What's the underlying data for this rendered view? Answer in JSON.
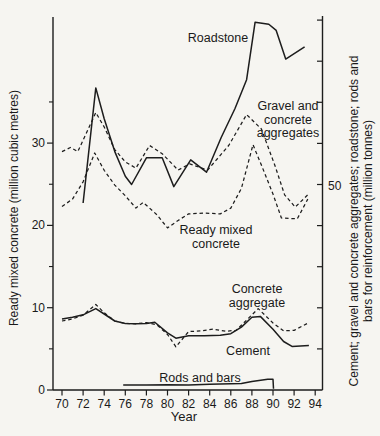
{
  "chart_data": {
    "type": "line",
    "title": "",
    "xlabel": "Year",
    "ylabel_left": "Ready mixed concrete (million cubic metres)",
    "ylabel_right": "Cement; gravel and concrete aggregates; roadstone; rods and bars for reinforcement (million tonnes)",
    "ylabel_right_lines": [
      "Cement; gravel and concrete aggregates; roadstone; rods and",
      "bars for reinforcement (million tonnes)"
    ],
    "colors": {
      "line": "#1d1d1d",
      "background": "#f6f5f1"
    },
    "x_axis": {
      "tick_years": [
        70,
        72,
        74,
        76,
        78,
        80,
        82,
        84,
        86,
        88,
        90,
        92,
        94
      ],
      "tick_labels": [
        "70",
        "72",
        "74",
        "76",
        "78",
        "80",
        "82",
        "84",
        "86",
        "88",
        "90",
        "92",
        "94"
      ],
      "range": [
        69.1,
        94.7
      ]
    },
    "left_axis": {
      "ticks": [
        0,
        10,
        20,
        30
      ],
      "tick_labels": [
        "0",
        "10",
        "20",
        "30"
      ],
      "minor_ticks": [
        5,
        15,
        25,
        35
      ],
      "range": [
        0,
        45.3
      ],
      "units": "million cubic metres"
    },
    "right_axis": {
      "ticks": [
        10,
        20,
        30,
        40,
        50,
        60,
        70,
        80,
        90
      ],
      "labeled_tick": 50,
      "labeled_tick_text": "50",
      "range": [
        0,
        91
      ],
      "units": "million tonnes"
    },
    "series": [
      {
        "id": "roadstone",
        "name": "Roadstone",
        "axis": "right",
        "style": "solid",
        "points": [
          [
            72,
            45.5
          ],
          [
            73.2,
            73.5
          ],
          [
            74,
            66
          ],
          [
            75,
            58
          ],
          [
            76,
            52
          ],
          [
            76.6,
            50
          ],
          [
            78,
            56.5
          ],
          [
            79.5,
            56.5
          ],
          [
            80.6,
            49.5
          ],
          [
            82.2,
            56
          ],
          [
            83.7,
            53
          ],
          [
            85.1,
            61.5
          ],
          [
            86.4,
            68.5
          ],
          [
            87.5,
            75.5
          ],
          [
            88.3,
            89.5
          ],
          [
            89.6,
            89
          ],
          [
            90.3,
            87.5
          ],
          [
            91.2,
            80.5
          ],
          [
            93,
            83.5
          ]
        ]
      },
      {
        "id": "gravel",
        "name": "Gravel and concrete aggregates",
        "axis": "right",
        "style": "dashed",
        "points": [
          [
            70,
            58
          ],
          [
            70.8,
            59
          ],
          [
            71.5,
            58
          ],
          [
            73.2,
            67.5
          ],
          [
            74,
            64
          ],
          [
            75,
            58.5
          ],
          [
            76,
            55.5
          ],
          [
            77,
            54
          ],
          [
            78.3,
            59.5
          ],
          [
            79.5,
            57.5
          ],
          [
            81,
            53.5
          ],
          [
            82.1,
            55
          ],
          [
            83.8,
            53.5
          ],
          [
            85.8,
            59.5
          ],
          [
            87.5,
            67
          ],
          [
            88.9,
            63.5
          ],
          [
            90.2,
            54.5
          ],
          [
            91.1,
            47.5
          ],
          [
            92.1,
            44.5
          ],
          [
            93.3,
            47.5
          ]
        ]
      },
      {
        "id": "ready-mixed",
        "name": "Ready mixed concrete",
        "axis": "left",
        "style": "dashed",
        "points": [
          [
            70,
            22.3
          ],
          [
            71,
            23.2
          ],
          [
            72,
            25.3
          ],
          [
            73.1,
            28.8
          ],
          [
            74,
            26.7
          ],
          [
            75,
            24.9
          ],
          [
            76,
            23.6
          ],
          [
            77,
            22.1
          ],
          [
            77.7,
            22.8
          ],
          [
            79,
            21.3
          ],
          [
            80,
            19.7
          ],
          [
            81,
            20.6
          ],
          [
            82,
            21.4
          ],
          [
            83.5,
            21.5
          ],
          [
            85,
            21.4
          ],
          [
            86,
            22.1
          ],
          [
            87,
            24.5
          ],
          [
            88.1,
            29.8
          ],
          [
            89,
            27
          ],
          [
            90,
            23.8
          ],
          [
            90.8,
            20.9
          ],
          [
            92.3,
            20.8
          ],
          [
            93.3,
            23.2
          ]
        ]
      },
      {
        "id": "concrete-aggregate",
        "name": "Concrete aggregate",
        "axis": "right",
        "style": "dashed",
        "points": [
          [
            70,
            16.8
          ],
          [
            71,
            17.3
          ],
          [
            72,
            18.2
          ],
          [
            73.2,
            20.8
          ],
          [
            74,
            18.8
          ],
          [
            75,
            16.8
          ],
          [
            76,
            16.2
          ],
          [
            77,
            16.1
          ],
          [
            78,
            16.4
          ],
          [
            79,
            15.9
          ],
          [
            80,
            13.5
          ],
          [
            80.8,
            10.5
          ],
          [
            82,
            14.2
          ],
          [
            83.2,
            14.4
          ],
          [
            84.3,
            14.8
          ],
          [
            85.5,
            14.3
          ],
          [
            86.5,
            14.5
          ],
          [
            87.5,
            17
          ],
          [
            88.6,
            19.8
          ],
          [
            90,
            16.3
          ],
          [
            91,
            14.4
          ],
          [
            92,
            14.5
          ],
          [
            93.4,
            16.4
          ]
        ]
      },
      {
        "id": "cement",
        "name": "Cement",
        "axis": "right",
        "style": "solid",
        "points": [
          [
            70,
            17.3
          ],
          [
            71,
            17.7
          ],
          [
            72,
            18.3
          ],
          [
            73.2,
            19.8
          ],
          [
            74,
            18.5
          ],
          [
            75,
            16.8
          ],
          [
            76,
            16.2
          ],
          [
            77,
            16.1
          ],
          [
            78,
            16.2
          ],
          [
            78.8,
            16.5
          ],
          [
            80,
            13.9
          ],
          [
            80.8,
            12.6
          ],
          [
            82,
            13.2
          ],
          [
            83.5,
            13.2
          ],
          [
            85,
            13.3
          ],
          [
            86,
            13.7
          ],
          [
            87,
            15.3
          ],
          [
            88,
            17.7
          ],
          [
            88.8,
            17.9
          ],
          [
            90,
            14.8
          ],
          [
            91,
            11.8
          ],
          [
            91.8,
            10.6
          ],
          [
            93.4,
            10.8
          ]
        ]
      },
      {
        "id": "rods",
        "name": "Rods and bars",
        "axis": "right",
        "style": "solid",
        "points": [
          [
            75.8,
            1.2
          ],
          [
            78,
            1.2
          ],
          [
            80,
            1.3
          ],
          [
            82,
            1.2
          ],
          [
            84,
            1.4
          ],
          [
            86,
            1.5
          ],
          [
            87,
            1.6
          ],
          [
            88,
            2.1
          ],
          [
            89.5,
            2.6
          ],
          [
            90,
            2.6
          ],
          [
            90.05,
            0.3
          ]
        ]
      }
    ],
    "annotations": [
      {
        "series": "roadstone",
        "lines": [
          "Roadstone"
        ],
        "x": 218,
        "y": 39
      },
      {
        "series": "gravel",
        "lines": [
          "Gravel and",
          "concrete",
          "aggregates"
        ],
        "x": 288,
        "y": 120
      },
      {
        "series": "ready-mixed",
        "lines": [
          "Ready mixed",
          "concrete"
        ],
        "x": 216,
        "y": 237
      },
      {
        "series": "concrete-aggregate",
        "lines": [
          "Concrete",
          "aggregate"
        ],
        "x": 257,
        "y": 296
      },
      {
        "series": "cement",
        "lines": [
          "Cement"
        ],
        "x": 248,
        "y": 352
      },
      {
        "series": "rods",
        "lines": [
          "Rods and bars"
        ],
        "x": 200,
        "y": 379
      }
    ],
    "legend": "none",
    "grid": false
  }
}
